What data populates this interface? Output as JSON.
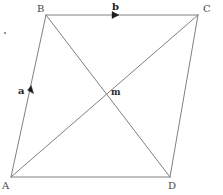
{
  "figure": {
    "type": "geometry-diagram",
    "shape": "parallelogram",
    "canvas": {
      "width": 223,
      "height": 195
    },
    "background_color": "#ffffff",
    "line_color": "#808080",
    "line_width": 1,
    "vertices": [
      {
        "id": "B",
        "label": "B",
        "x": 46,
        "y": 15,
        "label_x": 37,
        "label_y": 4
      },
      {
        "id": "C",
        "label": "C",
        "x": 198,
        "y": 15,
        "label_x": 203,
        "label_y": 4
      },
      {
        "id": "D",
        "label": "D",
        "x": 170,
        "y": 177,
        "label_x": 168,
        "label_y": 181
      },
      {
        "id": "A",
        "label": "A",
        "x": 11,
        "y": 177,
        "label_x": 2,
        "label_y": 181
      }
    ],
    "edges": [
      {
        "name": "edge-AB",
        "from": "A",
        "to": "B"
      },
      {
        "name": "edge-BC",
        "from": "B",
        "to": "C"
      },
      {
        "name": "edge-CD",
        "from": "C",
        "to": "D"
      },
      {
        "name": "edge-DA",
        "from": "D",
        "to": "A"
      }
    ],
    "diagonals": [
      {
        "name": "diagonal-AC",
        "from": "A",
        "to": "C"
      },
      {
        "name": "diagonal-BD",
        "from": "B",
        "to": "D"
      }
    ],
    "intersection": {
      "id": "m",
      "label": "m",
      "x": 106,
      "y": 91,
      "label_x": 111,
      "label_y": 88
    },
    "vectors": [
      {
        "id": "a",
        "label": "a",
        "along_edge": "edge-AB",
        "direction": "up",
        "label_x": 18,
        "label_y": 86,
        "arrow_x": 31,
        "arrow_y": 92
      },
      {
        "id": "b",
        "label": "b",
        "along_edge": "edge-BC",
        "direction": "right",
        "label_x": 112,
        "label_y": 3,
        "arrow_x": 116,
        "arrow_y": 15
      }
    ],
    "stray_mark": {
      "x": 4,
      "y": 32
    }
  }
}
